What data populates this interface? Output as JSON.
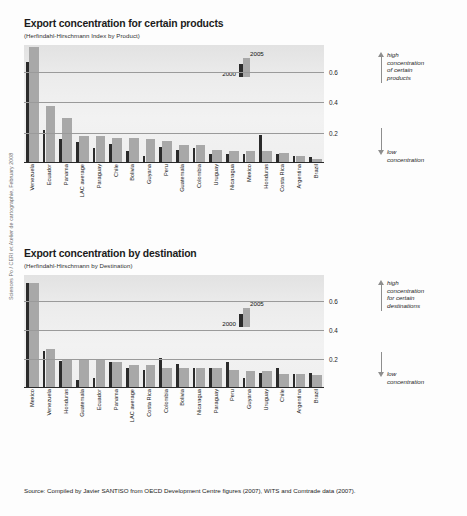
{
  "credit": "Sciences Po / CERI et Atelier de cartographie, February 2008",
  "source": "Source: Compiled by Javier SANTISO from OECD Development Centre figures (2007), WITS and Comtrade data (2007).",
  "legend": {
    "old_label": "2000",
    "new_label": "2005"
  },
  "colors": {
    "bar_2000": "#2b2b2b",
    "bar_2005": "#a8a8a8",
    "plot_bg": "#ececec",
    "grid": "#9a9a9a",
    "axis": "#2a2a2a",
    "arrow": "#8e8e8e"
  },
  "charts": [
    {
      "title": "Export concentration for certain products",
      "subtitle": "(Herfindahl-Hirschmann Index by Product)",
      "annotation_high": "high\nconcentration\nof certain\nproducts",
      "annotation_low": "low\nconcentration",
      "chart_data": {
        "type": "bar",
        "title": "Export concentration for certain products",
        "subtitle": "(Herfindahl-Hirschmann Index by Product)",
        "xlabel": "",
        "ylabel": "Herfindahl-Hirschmann Index",
        "ylim": [
          0,
          0.78
        ],
        "yticks": [
          0.2,
          0.4,
          0.6
        ],
        "grid": true,
        "legend_position": "inside-upper-right",
        "categories": [
          "Venezuela",
          "Ecuador",
          "Panama",
          "LAC average",
          "Paraguay",
          "Chile",
          "Bolivia",
          "Guyana",
          "Peru",
          "Guatemala",
          "Colombia",
          "Uruguay",
          "Nicaragua",
          "Mexico",
          "Honduras",
          "Costa Rica",
          "Argentina",
          "Brazil"
        ],
        "series": [
          {
            "name": "2000",
            "values": [
              0.66,
              0.21,
              0.15,
              0.13,
              0.09,
              0.12,
              0.07,
              0.04,
              0.1,
              0.08,
              0.09,
              0.05,
              0.05,
              0.05,
              0.18,
              0.05,
              0.04,
              0.03
            ]
          },
          {
            "name": "2005",
            "values": [
              0.76,
              0.37,
              0.29,
              0.17,
              0.17,
              0.16,
              0.16,
              0.15,
              0.14,
              0.11,
              0.11,
              0.08,
              0.07,
              0.07,
              0.07,
              0.06,
              0.04,
              0.02
            ]
          }
        ]
      }
    },
    {
      "title": "Export concentration by destination",
      "subtitle": "(Herfindahl-Hirschmann by Destination)",
      "annotation_high": "high\nconcentration\nfor certain\ndestinations",
      "annotation_low": "low\nconcentration",
      "chart_data": {
        "type": "bar",
        "title": "Export concentration by destination",
        "subtitle": "(Herfindahl-Hirschmann by Destination)",
        "xlabel": "",
        "ylabel": "Herfindahl-Hirschmann Index",
        "ylim": [
          0,
          0.78
        ],
        "yticks": [
          0.2,
          0.4,
          0.6
        ],
        "grid": true,
        "legend_position": "inside-upper-right",
        "categories": [
          "Mexico",
          "Venezuela",
          "Honduras",
          "Guatemala",
          "Ecuador",
          "Panama",
          "LAC average",
          "Costa Rica",
          "Colombia",
          "Bolivia",
          "Nicaragua",
          "Paraguay",
          "Peru",
          "Guyana",
          "Uruguay",
          "Chile",
          "Argentina",
          "Brazil"
        ],
        "series": [
          {
            "name": "2000",
            "values": [
              0.72,
              0.25,
              0.18,
              0.05,
              0.06,
              0.17,
              0.13,
              0.12,
              0.2,
              0.16,
              0.13,
              0.13,
              0.17,
              0.06,
              0.1,
              0.13,
              0.09,
              0.1
            ]
          },
          {
            "name": "2005",
            "values": [
              0.72,
              0.26,
              0.19,
              0.19,
              0.19,
              0.17,
              0.15,
              0.15,
              0.13,
              0.13,
              0.13,
              0.13,
              0.12,
              0.11,
              0.11,
              0.09,
              0.09,
              0.08
            ]
          }
        ]
      }
    }
  ]
}
